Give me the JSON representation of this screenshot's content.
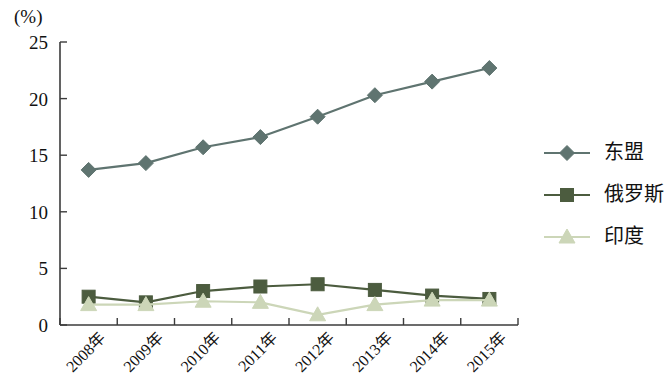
{
  "axis_unit_label": "(%)",
  "legend": {
    "position": "right",
    "items": [
      {
        "label": "东盟",
        "marker": "diamond-marker-icon",
        "color": "#5f7470"
      },
      {
        "label": "俄罗斯",
        "marker": "square-marker-icon",
        "color": "#4c5c3f"
      },
      {
        "label": "印度",
        "marker": "triangle-marker-icon",
        "color": "#ccd6b8"
      }
    ]
  },
  "chart_data": {
    "type": "line",
    "title": "",
    "subtitle": "",
    "xlabel": "",
    "ylabel": "(%)",
    "categories": [
      "2008年",
      "2009年",
      "2010年",
      "2011年",
      "2012年",
      "2013年",
      "2014年",
      "2015年"
    ],
    "ylim": [
      0,
      25
    ],
    "yticks": [
      0,
      5,
      10,
      15,
      20,
      25
    ],
    "ytick_labels": [
      "0",
      "5",
      "10",
      "15",
      "20",
      "25"
    ],
    "grid": false,
    "xtick_rotation": -45,
    "series": [
      {
        "name": "东盟",
        "color": "#5f7470",
        "marker": "diamond",
        "values": [
          13.7,
          14.3,
          15.7,
          16.6,
          18.4,
          20.3,
          21.5,
          22.7
        ]
      },
      {
        "name": "俄罗斯",
        "color": "#4c5c3f",
        "marker": "square",
        "values": [
          2.5,
          2.0,
          3.0,
          3.4,
          3.6,
          3.1,
          2.6,
          2.3
        ]
      },
      {
        "name": "印度",
        "color": "#ccd6b8",
        "marker": "triangle",
        "values": [
          1.8,
          1.8,
          2.1,
          2.0,
          0.9,
          1.8,
          2.2,
          2.2
        ]
      }
    ]
  }
}
